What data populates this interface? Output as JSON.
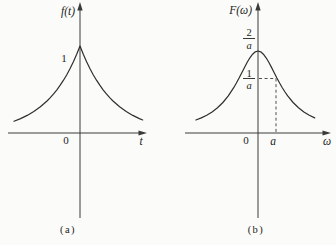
{
  "figure": {
    "background": "#fbfbf9",
    "ink": "#2e2e2e",
    "plots": [
      {
        "caption": "(a)",
        "y_axis_label": "f(t)",
        "x_axis_label": "t",
        "origin_label": "0",
        "peak_label": "1"
      },
      {
        "caption": "(b)",
        "y_axis_label": "F(ω)",
        "x_axis_label": "ω",
        "origin_label": "0",
        "x_tick_label": "a",
        "peak_frac": {
          "num": "2",
          "den": "a"
        },
        "half_frac": {
          "num": "1",
          "den": "a"
        }
      }
    ]
  },
  "chart_data": [
    {
      "type": "line",
      "title": "f(t) = e^(-a|t|)",
      "xlabel": "t",
      "ylabel": "f(t)",
      "x_range": [
        -2,
        1.9
      ],
      "y_range": [
        0,
        1
      ],
      "grid": false,
      "annotations": [
        {
          "text": "1",
          "meaning": "peak value at t=0"
        },
        {
          "text": "0",
          "meaning": "origin"
        }
      ],
      "series": [
        {
          "name": "f(t)",
          "x": [
            -2,
            -1.8,
            -1.6,
            -1.4,
            -1.2,
            -1,
            -0.9,
            -0.8,
            -0.7,
            -0.6,
            -0.5,
            -0.4,
            -0.3,
            -0.2,
            -0.1,
            -0.05,
            0,
            0.05,
            0.1,
            0.2,
            0.3,
            0.4,
            0.5,
            0.6,
            0.7,
            0.8,
            0.9,
            1,
            1.2,
            1.4,
            1.6,
            1.8,
            1.9
          ],
          "y": [
            0.135,
            0.165,
            0.202,
            0.247,
            0.301,
            0.368,
            0.407,
            0.449,
            0.497,
            0.549,
            0.607,
            0.67,
            0.741,
            0.819,
            0.905,
            0.951,
            1,
            0.951,
            0.905,
            0.819,
            0.741,
            0.67,
            0.607,
            0.549,
            0.497,
            0.449,
            0.407,
            0.368,
            0.301,
            0.247,
            0.202,
            0.165,
            0.15
          ]
        }
      ]
    },
    {
      "type": "line",
      "title": "F(ω) = 2a/(a²+ω²)",
      "xlabel": "ω",
      "ylabel": "F(ω)",
      "x_range": [
        -2.3,
        2.1
      ],
      "y_range": [
        0,
        2
      ],
      "grid": false,
      "annotations": [
        {
          "text": "2/a",
          "meaning": "peak value at ω=0"
        },
        {
          "text": "1/a",
          "meaning": "value at ω=a, marked with dashed guides"
        },
        {
          "text": "a",
          "meaning": "x position of dashed guide"
        },
        {
          "text": "0",
          "meaning": "origin"
        }
      ],
      "series": [
        {
          "name": "F(ω)",
          "x": [
            -2.3,
            -2.1,
            -1.9,
            -1.7,
            -1.5,
            -1.3,
            -1.1,
            -0.9,
            -0.8,
            -0.7,
            -0.6,
            -0.5,
            -0.4,
            -0.3,
            -0.2,
            -0.1,
            0,
            0.1,
            0.2,
            0.3,
            0.4,
            0.5,
            0.6,
            0.7,
            0.8,
            0.9,
            1,
            1.1,
            1.3,
            1.5,
            1.7,
            1.9,
            2.1
          ],
          "y": [
            0.317,
            0.368,
            0.434,
            0.514,
            0.615,
            0.743,
            0.905,
            1.105,
            1.22,
            1.342,
            1.471,
            1.6,
            1.724,
            1.835,
            1.923,
            1.98,
            2,
            1.98,
            1.923,
            1.835,
            1.724,
            1.6,
            1.471,
            1.342,
            1.22,
            1.105,
            1,
            0.905,
            0.743,
            0.615,
            0.514,
            0.434,
            0.368
          ]
        }
      ]
    }
  ]
}
